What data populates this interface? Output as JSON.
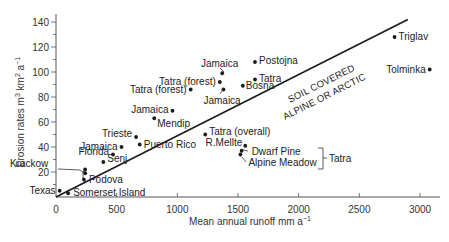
{
  "chart_data": {
    "type": "scatter",
    "title": "",
    "xlabel": "Mean annual runoff mm a⁻¹",
    "ylabel": "Erosion rates m³ km² a⁻¹",
    "xlim": [
      0,
      3200
    ],
    "ylim": [
      0,
      145
    ],
    "x_ticks": [
      0,
      500,
      1000,
      1500,
      2000,
      2500,
      3000
    ],
    "y_ticks": [
      20,
      40,
      60,
      80,
      100,
      120,
      140
    ],
    "grid": false,
    "legend": null,
    "points": [
      {
        "label": "Texas",
        "x": 30,
        "y": 5
      },
      {
        "label": "Somerset Island",
        "x": 100,
        "y": 3
      },
      {
        "label": "Podova",
        "x": 230,
        "y": 14
      },
      {
        "label": "Krackow",
        "x": 240,
        "y": 19
      },
      {
        "label": "Krackow",
        "x": 240,
        "y": 22
      },
      {
        "label": "Senj",
        "x": 390,
        "y": 28
      },
      {
        "label": "Florida",
        "x": 470,
        "y": 34
      },
      {
        "label": "Jamaica",
        "x": 540,
        "y": 40
      },
      {
        "label": "Trieste",
        "x": 660,
        "y": 48
      },
      {
        "label": "Puerto Rico",
        "x": 690,
        "y": 42
      },
      {
        "label": "Mendip",
        "x": 810,
        "y": 63
      },
      {
        "label": "Jamaica",
        "x": 960,
        "y": 69
      },
      {
        "label": "Tatra (forest)",
        "x": 1110,
        "y": 86
      },
      {
        "label": "Tatra (forest)",
        "x": 1350,
        "y": 92
      },
      {
        "label": "Jamaica",
        "x": 1370,
        "y": 99
      },
      {
        "label": "Jamaica",
        "x": 1380,
        "y": 86
      },
      {
        "label": "Bosna",
        "x": 1540,
        "y": 89
      },
      {
        "label": "Tatra",
        "x": 1640,
        "y": 94
      },
      {
        "label": "Postojna",
        "x": 1640,
        "y": 108
      },
      {
        "label": "Tatra (overall)",
        "x": 1230,
        "y": 50
      },
      {
        "label": "R.Mellte",
        "x": 1560,
        "y": 41
      },
      {
        "label": "Dwarf Pine",
        "x": 1530,
        "y": 37
      },
      {
        "label": "Alpine Meadow",
        "x": 1520,
        "y": 34
      },
      {
        "label": "Triglav",
        "x": 2790,
        "y": 128
      },
      {
        "label": "Tolminka",
        "x": 3080,
        "y": 102
      }
    ],
    "annotations": [
      {
        "text": "SOIL COVERED",
        "position": "above line"
      },
      {
        "text": "ALPINE OR ARCTIC",
        "position": "below line"
      },
      {
        "text": "Tatra",
        "brackets": [
          "Dwarf Pine",
          "Alpine Meadow"
        ]
      }
    ],
    "trend_line": {
      "from": [
        0,
        0
      ],
      "to": [
        2900,
        142
      ]
    }
  },
  "labels": {
    "xlabel": "Mean annual runoff mm a",
    "xlabel_sup": "−1",
    "ylabel_main": "Erosion rates m",
    "ylabel_sup1": "3",
    "ylabel_mid": " km",
    "ylabel_sup2": "2",
    "ylabel_end": " a",
    "ylabel_sup3": "−1",
    "band_upper": "SOIL COVERED",
    "band_lower": "ALPINE OR ARCTIC",
    "tatra_group": "Tatra"
  },
  "ticks": {
    "x": [
      "0",
      "500",
      "1000",
      "1500",
      "2000",
      "2500",
      "3000"
    ],
    "y": [
      "20",
      "40",
      "60",
      "80",
      "100",
      "120",
      "140"
    ]
  },
  "colors": {
    "ink": "#1a1a1a",
    "axis": "#555555",
    "background": "#ffffff"
  }
}
